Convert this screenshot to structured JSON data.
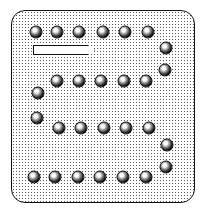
{
  "board": {
    "pegs": [
      {
        "x": 36,
        "y": 32
      },
      {
        "x": 57,
        "y": 32
      },
      {
        "x": 79,
        "y": 32
      },
      {
        "x": 103,
        "y": 32
      },
      {
        "x": 125,
        "y": 32
      },
      {
        "x": 148,
        "y": 32
      },
      {
        "x": 166,
        "y": 48
      },
      {
        "x": 165,
        "y": 70
      },
      {
        "x": 57,
        "y": 81
      },
      {
        "x": 79,
        "y": 81
      },
      {
        "x": 101,
        "y": 81
      },
      {
        "x": 124,
        "y": 81
      },
      {
        "x": 146,
        "y": 81
      },
      {
        "x": 38,
        "y": 93
      },
      {
        "x": 37,
        "y": 118
      },
      {
        "x": 59,
        "y": 128
      },
      {
        "x": 81,
        "y": 128
      },
      {
        "x": 104,
        "y": 128
      },
      {
        "x": 126,
        "y": 128
      },
      {
        "x": 149,
        "y": 128
      },
      {
        "x": 167,
        "y": 145
      },
      {
        "x": 166,
        "y": 167
      },
      {
        "x": 34,
        "y": 177
      },
      {
        "x": 55,
        "y": 177
      },
      {
        "x": 78,
        "y": 177
      },
      {
        "x": 100,
        "y": 177
      },
      {
        "x": 123,
        "y": 177
      },
      {
        "x": 146,
        "y": 177
      }
    ],
    "colors": {
      "background": "#ffffff",
      "border": "#111111",
      "peg": "#000000"
    }
  }
}
